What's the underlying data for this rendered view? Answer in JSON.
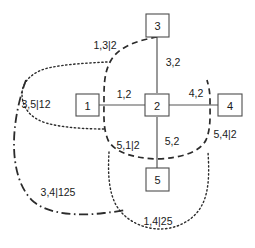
{
  "figure": {
    "background_color": "#ffffff",
    "stroke_color": "#2b2b2b",
    "node_stroke_color": "#4d4d4d",
    "edge_color": "#555555",
    "text_color": "#1a1a1a",
    "width": 255,
    "height": 248
  },
  "nodes": [
    {
      "id": "1",
      "label": "1",
      "x": 87,
      "y": 105
    },
    {
      "id": "2",
      "label": "2",
      "x": 157,
      "y": 105
    },
    {
      "id": "3",
      "label": "3",
      "x": 157,
      "y": 25
    },
    {
      "id": "4",
      "label": "4",
      "x": 230,
      "y": 105
    },
    {
      "id": "5",
      "label": "5",
      "x": 157,
      "y": 180
    }
  ],
  "edges": [
    {
      "id": "e-1-2",
      "from": "1",
      "to": "2",
      "label": "1,2",
      "label_x": 124,
      "label_y": 94
    },
    {
      "id": "e-3-2",
      "from": "3",
      "to": "2",
      "label": "3,2",
      "label_x": 173,
      "label_y": 62
    },
    {
      "id": "e-2-4",
      "from": "2",
      "to": "4",
      "label": "4,2",
      "label_x": 196,
      "label_y": 93
    },
    {
      "id": "e-2-5",
      "from": "2",
      "to": "5",
      "label": "5,2",
      "label_x": 172,
      "label_y": 141
    }
  ],
  "cutsets": [
    {
      "id": "cut-1-3-2",
      "label": "1,3|2",
      "style": "dashed",
      "label_x": 105,
      "label_y": 45
    },
    {
      "id": "cut-5-1-2",
      "label": "5,1|2",
      "style": "dashed",
      "label_x": 128,
      "label_y": 145
    },
    {
      "id": "cut-5-4-2",
      "label": "5,4|2",
      "style": "dashed",
      "label_x": 225,
      "label_y": 134
    },
    {
      "id": "cut-3-5-12",
      "label": "3,5|12",
      "style": "dotted",
      "label_x": 36,
      "label_y": 104
    },
    {
      "id": "cut-1-4-25",
      "label": "1,4|25",
      "style": "dotted",
      "label_x": 158,
      "label_y": 221
    },
    {
      "id": "cut-3-4-125",
      "label": "3,4|125",
      "style": "dashdot",
      "label_x": 58,
      "label_y": 192
    }
  ],
  "legend": {
    "notation": "separator-notation",
    "description": "A,B|S"
  }
}
